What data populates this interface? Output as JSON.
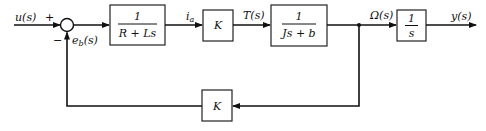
{
  "diagram": {
    "type": "block-diagram",
    "input": {
      "label": "u(s)"
    },
    "summing_junction": {
      "plus_sign": "+",
      "minus_sign": "−",
      "feedback_label_main": "e",
      "feedback_label_sub": "b",
      "feedback_label_tail": "(s)"
    },
    "blocks": [
      {
        "id": "electrical",
        "numerator": "1",
        "denominator": "R + Ls"
      },
      {
        "id": "torque-gain",
        "text": "K"
      },
      {
        "id": "mechanical",
        "numerator": "1",
        "denominator": "Js + b"
      },
      {
        "id": "integrator",
        "numerator": "1",
        "denominator": "s"
      },
      {
        "id": "back-emf-gain",
        "text": "K"
      }
    ],
    "signals": {
      "current_main": "i",
      "current_sub": "a",
      "torque": "T(s)",
      "speed": "Ω(s)",
      "output": "y(s)"
    }
  },
  "colors": {
    "line": "#111111",
    "background": "#ffffff"
  }
}
